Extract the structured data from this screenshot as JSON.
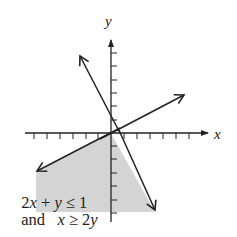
{
  "figure": {
    "type": "graph-of-system-of-linear-inequalities",
    "axes": {
      "x_label": "x",
      "y_label": "y",
      "x_ticks_left": 6,
      "x_ticks_right": 6,
      "y_ticks_above": 6,
      "y_ticks_below": 6
    },
    "lines": [
      {
        "name": "line-2x-plus-y-equals-1",
        "equation": "2x + y = 1"
      },
      {
        "name": "line-x-equals-2y",
        "equation": "x = 2y"
      }
    ],
    "shaded_region": {
      "description": "region satisfying both inequalities",
      "fill_color": "#d4d4d4"
    },
    "inequalities": {
      "line1_a": "2",
      "line1_var1": "x",
      "line1_op": " + ",
      "line1_var2": "y",
      "line1_rel": " ≤ 1",
      "line2_and": "and",
      "line2_var1": "x",
      "line2_rel": " ≥ 2",
      "line2_var2": "y"
    },
    "colors": {
      "line": "#222222",
      "shade": "#d4d4d4",
      "background": "#ffffff"
    }
  }
}
